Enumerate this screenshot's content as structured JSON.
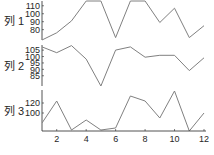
{
  "chart_data": {
    "type": "line",
    "layout": "stacked-subplots",
    "shared_x": true,
    "x": [
      1,
      2,
      3,
      4,
      5,
      6,
      7,
      8,
      9,
      10,
      11,
      12
    ],
    "x_ticks": [
      2,
      4,
      6,
      8,
      10,
      12
    ],
    "xlim": [
      1,
      12
    ],
    "grid": false,
    "legend": "none",
    "line_color": "#808080",
    "axis_color": "#262626",
    "series": [
      {
        "name": "列 1",
        "values": [
          67,
          76,
          91,
          116,
          116,
          70,
          116,
          116,
          89,
          107,
          70,
          85
        ],
        "ylim": [
          67,
          116
        ],
        "y_ticks": [
          80,
          90,
          100,
          110
        ]
      },
      {
        "name": "列 2",
        "values": [
          107.5,
          103,
          108.5,
          98,
          77,
          105,
          107.5,
          99.5,
          101,
          101,
          89,
          99
        ],
        "ylim": [
          77,
          109
        ],
        "y_ticks": [
          85,
          90,
          95,
          100,
          105
        ]
      },
      {
        "name": "列 3",
        "values": [
          80,
          124,
          66,
          86,
          66,
          70,
          134,
          124,
          90,
          144,
          64,
          100
        ],
        "ylim": [
          64,
          146
        ],
        "y_ticks": [
          100,
          120
        ]
      }
    ]
  }
}
